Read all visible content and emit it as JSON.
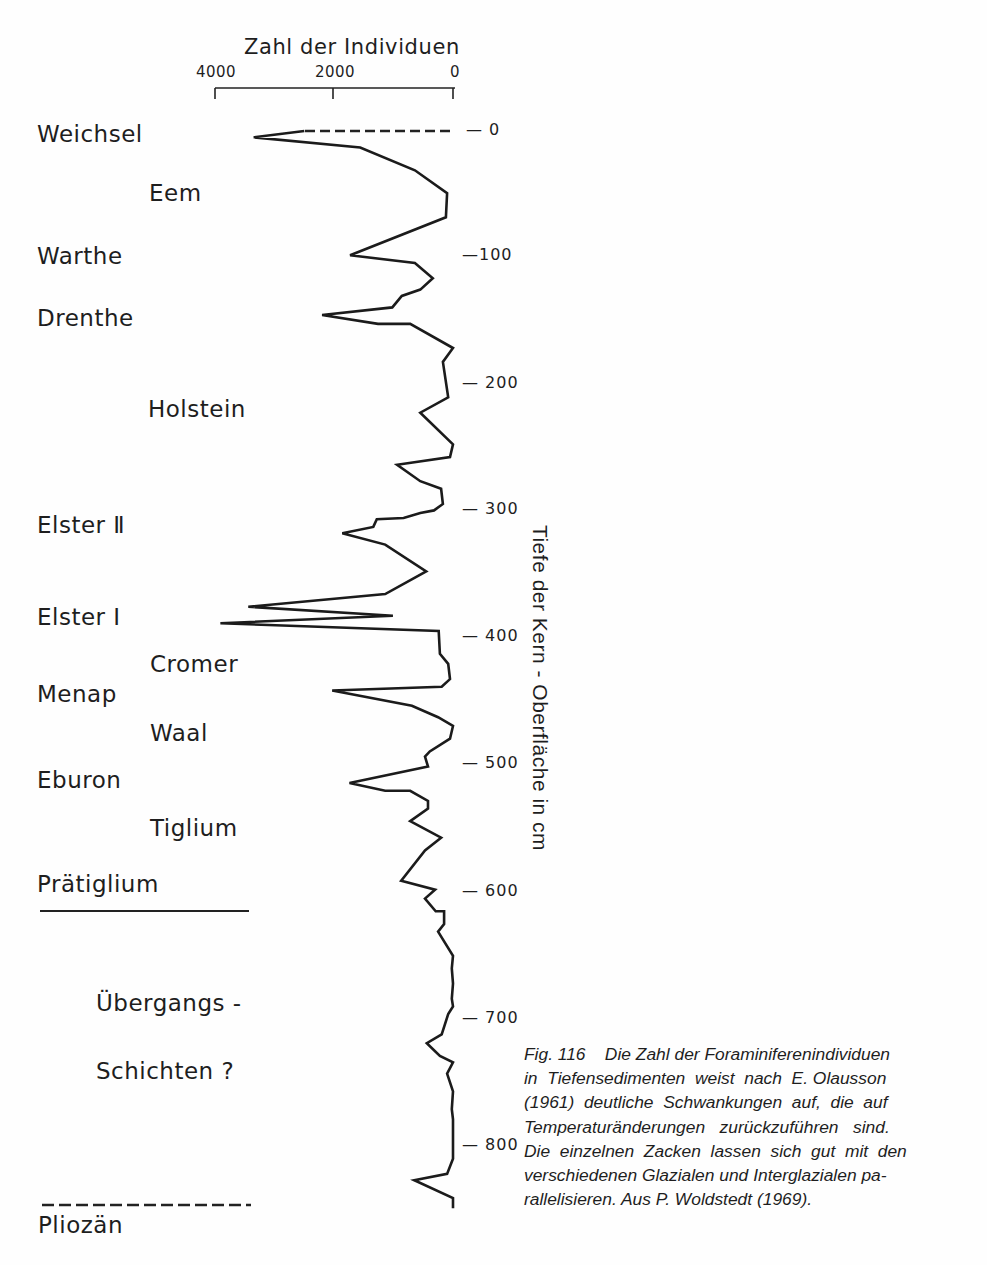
{
  "header_fragment": "",
  "chart_data": {
    "type": "line",
    "orientation": "vertical-depth",
    "title": "",
    "xlabel": "Zahl der Individuen",
    "ylabel": "Tiefe der Kern - Oberfläche in cm",
    "x_ticks": [
      "4000",
      "2000",
      "0"
    ],
    "x_tick_values": [
      4000,
      2000,
      0
    ],
    "y_ticks": [
      "0",
      "100",
      "200",
      "300",
      "400",
      "500",
      "600",
      "700",
      "800"
    ],
    "y_tick_values": [
      0,
      100,
      200,
      300,
      400,
      500,
      600,
      700,
      800
    ],
    "xlim": [
      4000,
      0
    ],
    "ylim": [
      0,
      850
    ],
    "x_inverted": true,
    "y_inverted": true,
    "grid": false,
    "dashed_segment": {
      "note": "top segment drawn dashed",
      "from": [
        2500,
        0
      ],
      "to": [
        0,
        0
      ]
    },
    "series": [
      {
        "name": "Foraminiferenindividuen",
        "points": [
          {
            "count": 3350,
            "depth": 5
          },
          {
            "count": 1560,
            "depth": 13
          },
          {
            "count": 640,
            "depth": 31
          },
          {
            "count": 100,
            "depth": 49
          },
          {
            "count": 120,
            "depth": 68
          },
          {
            "count": 1730,
            "depth": 98
          },
          {
            "count": 640,
            "depth": 104
          },
          {
            "count": 340,
            "depth": 116
          },
          {
            "count": 550,
            "depth": 125
          },
          {
            "count": 860,
            "depth": 130
          },
          {
            "count": 1020,
            "depth": 139
          },
          {
            "count": 2200,
            "depth": 145
          },
          {
            "count": 1260,
            "depth": 152
          },
          {
            "count": 720,
            "depth": 152
          },
          {
            "count": 0,
            "depth": 171
          },
          {
            "count": 170,
            "depth": 182
          },
          {
            "count": 80,
            "depth": 210
          },
          {
            "count": 550,
            "depth": 222
          },
          {
            "count": 0,
            "depth": 247
          },
          {
            "count": 50,
            "depth": 257
          },
          {
            "count": 940,
            "depth": 263
          },
          {
            "count": 550,
            "depth": 276
          },
          {
            "count": 200,
            "depth": 282
          },
          {
            "count": 170,
            "depth": 294
          },
          {
            "count": 320,
            "depth": 299
          },
          {
            "count": 550,
            "depth": 301
          },
          {
            "count": 830,
            "depth": 305
          },
          {
            "count": 1280,
            "depth": 306
          },
          {
            "count": 1340,
            "depth": 312
          },
          {
            "count": 1860,
            "depth": 317
          },
          {
            "count": 1140,
            "depth": 326
          },
          {
            "count": 450,
            "depth": 347
          },
          {
            "count": 1140,
            "depth": 365
          },
          {
            "count": 3440,
            "depth": 375
          },
          {
            "count": 1010,
            "depth": 382
          },
          {
            "count": 3910,
            "depth": 388
          },
          {
            "count": 240,
            "depth": 394
          },
          {
            "count": 220,
            "depth": 412
          },
          {
            "count": 80,
            "depth": 420
          },
          {
            "count": 50,
            "depth": 432
          },
          {
            "count": 190,
            "depth": 438
          },
          {
            "count": 2030,
            "depth": 441
          },
          {
            "count": 690,
            "depth": 453
          },
          {
            "count": 250,
            "depth": 462
          },
          {
            "count": 0,
            "depth": 469
          },
          {
            "count": 50,
            "depth": 479
          },
          {
            "count": 390,
            "depth": 489
          },
          {
            "count": 470,
            "depth": 493
          },
          {
            "count": 420,
            "depth": 501
          },
          {
            "count": 1740,
            "depth": 514
          },
          {
            "count": 1140,
            "depth": 520
          },
          {
            "count": 720,
            "depth": 520
          },
          {
            "count": 420,
            "depth": 528
          },
          {
            "count": 420,
            "depth": 534
          },
          {
            "count": 720,
            "depth": 544
          },
          {
            "count": 200,
            "depth": 557
          },
          {
            "count": 470,
            "depth": 567
          },
          {
            "count": 870,
            "depth": 591
          },
          {
            "count": 300,
            "depth": 598
          },
          {
            "count": 470,
            "depth": 605
          },
          {
            "count": 290,
            "depth": 615
          },
          {
            "count": 150,
            "depth": 615
          },
          {
            "count": 150,
            "depth": 625
          },
          {
            "count": 250,
            "depth": 631
          },
          {
            "count": 0,
            "depth": 650
          },
          {
            "count": 20,
            "depth": 660
          },
          {
            "count": 0,
            "depth": 672
          },
          {
            "count": 20,
            "depth": 684
          },
          {
            "count": 0,
            "depth": 690
          },
          {
            "count": 80,
            "depth": 696
          },
          {
            "count": 190,
            "depth": 712
          },
          {
            "count": 440,
            "depth": 719
          },
          {
            "count": 220,
            "depth": 729
          },
          {
            "count": 0,
            "depth": 734
          },
          {
            "count": 100,
            "depth": 743
          },
          {
            "count": 0,
            "depth": 757
          },
          {
            "count": 20,
            "depth": 771
          },
          {
            "count": 0,
            "depth": 779
          },
          {
            "count": 0,
            "depth": 810
          },
          {
            "count": 100,
            "depth": 822
          },
          {
            "count": 650,
            "depth": 827
          },
          {
            "count": 0,
            "depth": 841
          },
          {
            "count": 0,
            "depth": 849
          }
        ]
      }
    ],
    "annotations": [
      {
        "text": "Weichsel",
        "depth": 0
      },
      {
        "text": "Eem",
        "depth": 50
      },
      {
        "text": "Warthe",
        "depth": 100
      },
      {
        "text": "Drenthe",
        "depth": 147
      },
      {
        "text": "Holstein",
        "depth": 220
      },
      {
        "text": "Elster II",
        "depth": 310
      },
      {
        "text": "Elster I",
        "depth": 386
      },
      {
        "text": "Cromer",
        "depth": 421
      },
      {
        "text": "Menap",
        "depth": 444
      },
      {
        "text": "Waal",
        "depth": 475
      },
      {
        "text": "Eburon",
        "depth": 510
      },
      {
        "text": "Tiglium",
        "depth": 547
      },
      {
        "text": "Prätiglium",
        "depth": 590
      },
      {
        "text": "Übergangs-",
        "depth": 700
      },
      {
        "text": "Schichten ?",
        "depth": 752
      },
      {
        "text": "Pliozän",
        "depth": 880
      }
    ]
  },
  "axes": {
    "x_title": "Zahl der Individuen",
    "x_ticks": [
      {
        "label": "4000"
      },
      {
        "label": "2000"
      },
      {
        "label": "0"
      }
    ],
    "y_title": "Tiefe der Kern - Oberfläche in cm",
    "y_ticks": [
      {
        "label": "— 0"
      },
      {
        "label": "—100"
      },
      {
        "label": "— 200"
      },
      {
        "label": "— 300"
      },
      {
        "label": "— 400"
      },
      {
        "label": "— 500"
      },
      {
        "label": "— 600"
      },
      {
        "label": "— 700"
      },
      {
        "label": "— 800"
      }
    ]
  },
  "stages": [
    {
      "label": "Weichsel"
    },
    {
      "label": "Eem"
    },
    {
      "label": "Warthe"
    },
    {
      "label": "Drenthe"
    },
    {
      "label": "Holstein"
    },
    {
      "label": "Elster Ⅱ"
    },
    {
      "label": "Elster I"
    },
    {
      "label": "Cromer"
    },
    {
      "label": "Menap"
    },
    {
      "label": "Waal"
    },
    {
      "label": "Eburon"
    },
    {
      "label": "Tiglium"
    },
    {
      "label": "Prätiglium"
    },
    {
      "label": "Übergangs -"
    },
    {
      "label": "Schichten ?"
    },
    {
      "label": "Pliozän"
    }
  ],
  "caption": {
    "lines": [
      "Fig. 116    Die Zahl der Foraminiferenindividuen",
      "in  Tiefensedimenten  weist  nach  E. Olausson",
      "(1961)  deutliche  Schwankungen  auf,  die  auf",
      "Temperaturänderungen   zurückzuführen   sind.",
      "Die  einzelnen  Zacken  lassen  sich  gut  mit  den",
      "verschiedenen Glazialen und Interglazialen pa-",
      "rallelisieren. Aus P. Woldstedt (1969)."
    ]
  }
}
